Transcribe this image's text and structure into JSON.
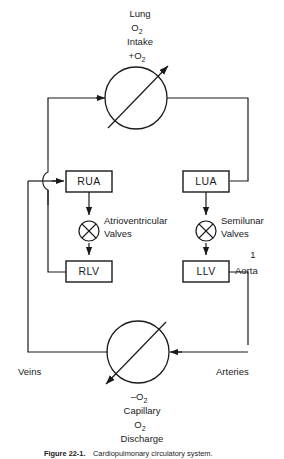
{
  "figure": {
    "title_top": {
      "line1": "Lung",
      "line2": "O",
      "line2_sub": "2",
      "line3": "Intake",
      "line4_prefix": "+O",
      "line4_sub": "2"
    },
    "title_bottom": {
      "line1_prefix": "–O",
      "line1_sub": "2",
      "line2": "Capillary",
      "line3": "O",
      "line3_sub": "2",
      "line4": "Discharge"
    },
    "nodes": [
      {
        "id": "lung",
        "type": "circle-with-arrow",
        "label": "Lung gas exchange"
      },
      {
        "id": "capillary",
        "type": "circle-with-arrow",
        "label": "Capillary gas exchange"
      }
    ],
    "boxes": [
      {
        "id": "rua",
        "label": "RUA"
      },
      {
        "id": "lua",
        "label": "LUA"
      },
      {
        "id": "rlv",
        "label": "RLV"
      },
      {
        "id": "llv",
        "label": "LLV"
      }
    ],
    "valves": [
      {
        "id": "av-valve",
        "name_line1": "Atrioventricular",
        "name_line2": "Valves"
      },
      {
        "id": "sl-valve",
        "name_line1": "Semilunar",
        "name_line2": "Valves"
      }
    ],
    "vessel_labels": {
      "veins": "Veins",
      "arteries": "Arteries",
      "aorta": "Aorta",
      "aorta_marker": "1"
    },
    "caption": {
      "number": "Figure 22-1.",
      "text": "Cardiopulmonary circulatory system."
    }
  },
  "colors": {
    "ink": "#1a1a1a",
    "background": "#ffffff"
  }
}
